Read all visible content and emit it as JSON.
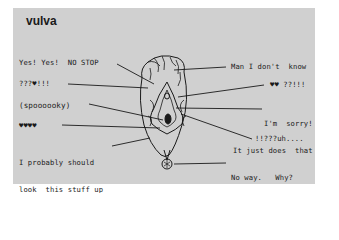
{
  "title": "vulva",
  "labels_left": [
    {
      "id": "yes-yes-no-stop",
      "text": "Yes! Yes!  NO STOP"
    },
    {
      "id": "question-heart",
      "text": "???♥!!!"
    },
    {
      "id": "spooky",
      "text": "(spoooooky)"
    },
    {
      "id": "four-hearts",
      "text": "♥♥♥♥"
    },
    {
      "id": "look-stuff-up",
      "line1": "I probably should",
      "line2": "look  this stuff up"
    }
  ],
  "labels_right": [
    {
      "id": "man-dont-know",
      "text": "Man I don't  know"
    },
    {
      "id": "two-hearts",
      "text": "♥♥ ??!!!"
    },
    {
      "id": "im-sorry",
      "line1": "I'm  sorry!",
      "line2": "It just does  that"
    },
    {
      "id": "uh",
      "text": "!!???uh...."
    },
    {
      "id": "no-way",
      "line1": "No way.   Why?",
      "line2": "Do you want to?"
    }
  ],
  "colors": {
    "panel": "#d0d0d0",
    "ink": "#1a1a1a",
    "background": "#ffffff"
  }
}
